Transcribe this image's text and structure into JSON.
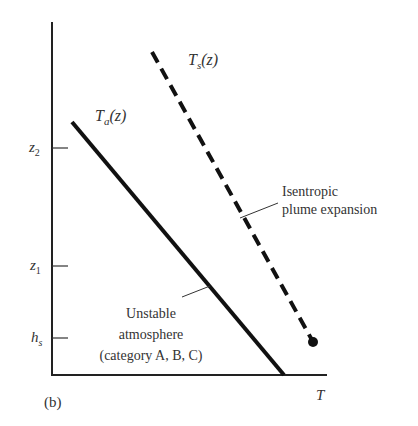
{
  "figure": {
    "panel_label": "(b)",
    "x_axis_label": "T",
    "y_ticks": [
      {
        "label_main": "z",
        "label_sub": "2",
        "y": 148
      },
      {
        "label_main": "z",
        "label_sub": "1",
        "y": 266
      },
      {
        "label_main": "h",
        "label_sub": "s",
        "y": 338
      }
    ],
    "curves": {
      "ambient": {
        "label_main": "T",
        "label_sub": "a",
        "label_arg": "(z)",
        "style": "solid"
      },
      "plume": {
        "label_main": "T",
        "label_sub": "s",
        "label_arg": "(z)",
        "style": "dashed"
      }
    },
    "annotations": {
      "plume": {
        "line1": "Isentropic",
        "line2": "plume expansion"
      },
      "atmosphere": {
        "line1": "Unstable",
        "line2": "atmosphere",
        "line3": "(category A, B, C)"
      }
    },
    "colors": {
      "line": "#111111",
      "text": "#333333",
      "background": "#ffffff"
    }
  }
}
